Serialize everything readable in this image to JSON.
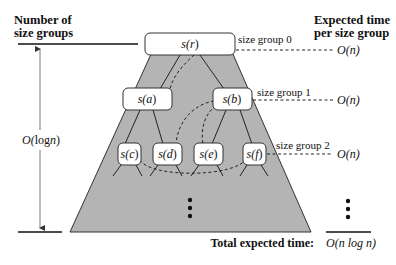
{
  "headers": {
    "left": [
      "Number of",
      "size groups"
    ],
    "right": [
      "Expected time",
      "per size group"
    ]
  },
  "left_axis": {
    "label_prefix": "O(",
    "label_fn": "log",
    "label_var": "n",
    "label_suffix": ")"
  },
  "nodes": {
    "r": {
      "fn": "s(",
      "var": "r",
      "close": ")"
    },
    "a": {
      "fn": "s(",
      "var": "a",
      "close": ")"
    },
    "b": {
      "fn": "s(",
      "var": "b",
      "close": ")"
    },
    "c": {
      "fn": "s(",
      "var": "c",
      "close": ")"
    },
    "d": {
      "fn": "s(",
      "var": "d",
      "close": ")"
    },
    "e": {
      "fn": "s(",
      "var": "e",
      "close": ")"
    },
    "f": {
      "fn": "s(",
      "var": "f",
      "close": ")"
    }
  },
  "size_groups": [
    {
      "label": "size group 0",
      "cost": "O(n)"
    },
    {
      "label": "size group 1",
      "cost": "O(n)"
    },
    {
      "label": "size group 2",
      "cost": "O(n)"
    }
  ],
  "footer": {
    "total_label": "Total expected time:",
    "total_value": "O(n log n)"
  },
  "colors": {
    "tree_fill": "#b4b4b4",
    "node_fill": "#ffffff",
    "line": "#222222"
  }
}
